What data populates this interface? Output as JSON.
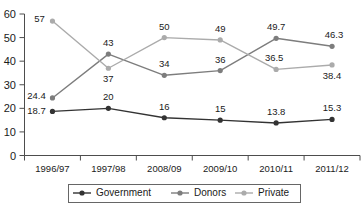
{
  "chart_data": {
    "type": "line",
    "title": "",
    "subtitle": "",
    "xlabel": "",
    "ylabel": "",
    "categories": [
      "1996/97",
      "1997/98",
      "2008/09",
      "2009/10",
      "2010/11",
      "2011/12"
    ],
    "ylim": [
      0,
      60
    ],
    "yticks": [
      0,
      10,
      20,
      30,
      40,
      50,
      60
    ],
    "grid": false,
    "legend_position": "bottom",
    "series": [
      {
        "name": "Government",
        "color": "#333333",
        "values": [
          18.7,
          20,
          16,
          15,
          13.8,
          15.3
        ],
        "labels": [
          "18.7",
          "20",
          "16",
          "15",
          "13.8",
          "15.3"
        ]
      },
      {
        "name": "Donors",
        "color": "#7d7d7d",
        "values": [
          24.4,
          43,
          34,
          36,
          49.7,
          46.3
        ],
        "labels": [
          "24.4",
          "43",
          "34",
          "36",
          "49.7",
          "46.3"
        ]
      },
      {
        "name": "Private",
        "color": "#ababab",
        "values": [
          57,
          37,
          50,
          49,
          36.5,
          38.4
        ],
        "labels": [
          "57",
          "37",
          "50",
          "49",
          "36.5",
          "38.4"
        ]
      }
    ]
  },
  "axis": {
    "y_tick_labels": [
      "60",
      "50",
      "40",
      "30",
      "20",
      "10",
      "0"
    ],
    "x_tick_labels": [
      "1996/97",
      "1997/98",
      "2008/09",
      "2009/10",
      "2010/11",
      "2011/12"
    ]
  },
  "legend": {
    "items": [
      {
        "label": "Government",
        "color": "#333333"
      },
      {
        "label": "Donors",
        "color": "#7d7d7d"
      },
      {
        "label": "Private",
        "color": "#ababab"
      }
    ]
  },
  "point_labels": {
    "government": [
      "18.7",
      "20",
      "16",
      "15",
      "13.8",
      "15.3"
    ],
    "donors": [
      "24.4",
      "43",
      "34",
      "36",
      "49.7",
      "46.3"
    ],
    "private": [
      "57",
      "37",
      "50",
      "49",
      "36.5",
      "38.4"
    ]
  }
}
